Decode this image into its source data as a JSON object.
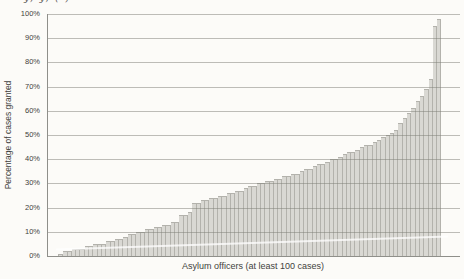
{
  "figure": {
    "cropped_title_fragment": "y, y, ( )",
    "background": "#fcfbf8"
  },
  "chart_data": {
    "type": "bar",
    "title": "",
    "xlabel": "Asylum officers (at least 100 cases)",
    "ylabel": "Percentage of cases granted",
    "ylim": [
      0,
      100
    ],
    "yticks": [
      "0%",
      "10%",
      "20%",
      "30%",
      "40%",
      "50%",
      "60%",
      "70%",
      "80%",
      "90%",
      "100%"
    ],
    "grid": "horizontal",
    "legend": "none",
    "sort_order": "ascending",
    "categories_note": "one bar per asylum officer, unlabeled",
    "values": [
      1,
      2,
      2,
      3,
      3,
      3,
      4,
      4,
      5,
      5,
      5,
      6,
      6,
      7,
      7,
      8,
      9,
      9,
      10,
      10,
      11,
      11,
      12,
      12,
      13,
      13,
      14,
      14,
      17,
      17,
      18,
      22,
      22,
      23,
      23,
      24,
      24,
      25,
      25,
      26,
      26,
      27,
      27,
      28,
      29,
      29,
      30,
      30,
      31,
      31,
      32,
      32,
      33,
      33,
      34,
      34,
      35,
      36,
      36,
      37,
      38,
      38,
      39,
      40,
      40,
      41,
      42,
      43,
      43,
      44,
      45,
      46,
      46,
      47,
      48,
      49,
      50,
      51,
      52,
      55,
      57,
      59,
      61,
      64,
      66,
      69,
      73,
      95,
      98
    ],
    "colors": {
      "bar_fill": "#d9d8d3",
      "bar_edge": "#b3b2ac",
      "gridline": "rgba(125,125,118,0.5)",
      "axis": "#8f8f8a",
      "text": "#3f3f3c",
      "background": "#fcfbf8"
    }
  }
}
